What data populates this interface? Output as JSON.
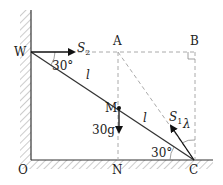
{
  "diagram": {
    "type": "statics-ladder",
    "points": {
      "W": "W",
      "A": "A",
      "B": "B",
      "M": "M",
      "O": "O",
      "N": "N",
      "C": "C"
    },
    "forces": {
      "S2": {
        "symbol": "S",
        "subscript": "2"
      },
      "S1": {
        "symbol": "S",
        "subscript": "1"
      },
      "weight": "30g"
    },
    "lengths": {
      "upper": "l",
      "lower": "l"
    },
    "angles": {
      "at_W": "30°",
      "at_C": "30°",
      "lambda": "λ"
    },
    "colors": {
      "line": "#333333",
      "dashed": "#aaaaaa",
      "hatch": "#888888"
    }
  }
}
